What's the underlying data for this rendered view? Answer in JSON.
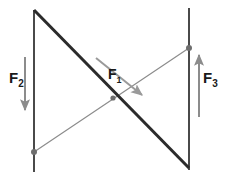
{
  "diagram": {
    "background_color": "#ffffff",
    "colors": {
      "beam": "#2b2b2b",
      "support_line": "#4a4a4a",
      "force_arrow": "#8c8c8c",
      "label_text": "#1a1a1a",
      "node": "#6e6e6e"
    },
    "labels": [
      {
        "id": "f1",
        "base": "F",
        "subscript": "1",
        "x": 108,
        "y": 66,
        "force_name": "F1",
        "arrow_direction": "down-right",
        "arrow_color": "#8c8c8c"
      },
      {
        "id": "f2",
        "base": "F",
        "subscript": "2",
        "x": 9,
        "y": 70,
        "force_name": "F2",
        "arrow_direction": "down",
        "arrow_color": "#8c8c8c"
      },
      {
        "id": "f3",
        "base": "F",
        "subscript": "3",
        "x": 203,
        "y": 70,
        "force_name": "F3",
        "arrow_direction": "up",
        "arrow_color": "#8c8c8c"
      }
    ],
    "lines": {
      "left_vertical": {
        "x1": 34,
        "y1": 10,
        "x2": 34,
        "y2": 172,
        "color": "#4a4a4a",
        "width": 2
      },
      "right_vertical": {
        "x1": 189,
        "y1": 8,
        "x2": 189,
        "y2": 170,
        "color": "#4a4a4a",
        "width": 2
      },
      "thick_diagonal": {
        "x1": 34,
        "y1": 10,
        "x2": 189,
        "y2": 168,
        "color": "#2b2b2b",
        "width": 3
      },
      "thin_diagonal": {
        "x1": 34,
        "y1": 152,
        "x2": 189,
        "y2": 48,
        "color": "#8c8c8c",
        "width": 1.2
      }
    },
    "arrows": {
      "f1": {
        "x1": 96,
        "y1": 58,
        "x2": 146,
        "y2": 98,
        "color": "#8c8c8c",
        "width": 2
      },
      "f2": {
        "x1": 25,
        "y1": 57,
        "x2": 25,
        "y2": 114,
        "color": "#8c8c8c",
        "width": 2
      },
      "f3": {
        "x1": 199,
        "y1": 117,
        "x2": 199,
        "y2": 51,
        "color": "#8c8c8c",
        "width": 2
      }
    },
    "nodes": [
      {
        "id": "node-bottom-left",
        "cx": 34,
        "cy": 152,
        "r": 3,
        "color": "#6e6e6e"
      },
      {
        "id": "node-top-right",
        "cx": 189,
        "cy": 48,
        "r": 3,
        "color": "#6e6e6e"
      },
      {
        "id": "node-center",
        "cx": 113,
        "cy": 98,
        "r": 2.6,
        "color": "#6e6e6e"
      }
    ]
  }
}
